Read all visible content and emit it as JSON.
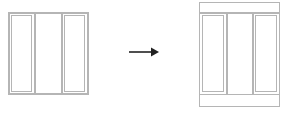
{
  "diagram": {
    "type": "before-after",
    "description_labels": [],
    "before": {
      "name": "three-panel-window",
      "panels": 3,
      "stroke_color": "#b0b0b0"
    },
    "arrow": {
      "direction": "right",
      "color": "#222222"
    },
    "after": {
      "name": "three-panel-window-with-top-and-bottom-bands",
      "panels": 3,
      "top_band": true,
      "bottom_band": true,
      "stroke_color": "#b0b0b0"
    }
  }
}
